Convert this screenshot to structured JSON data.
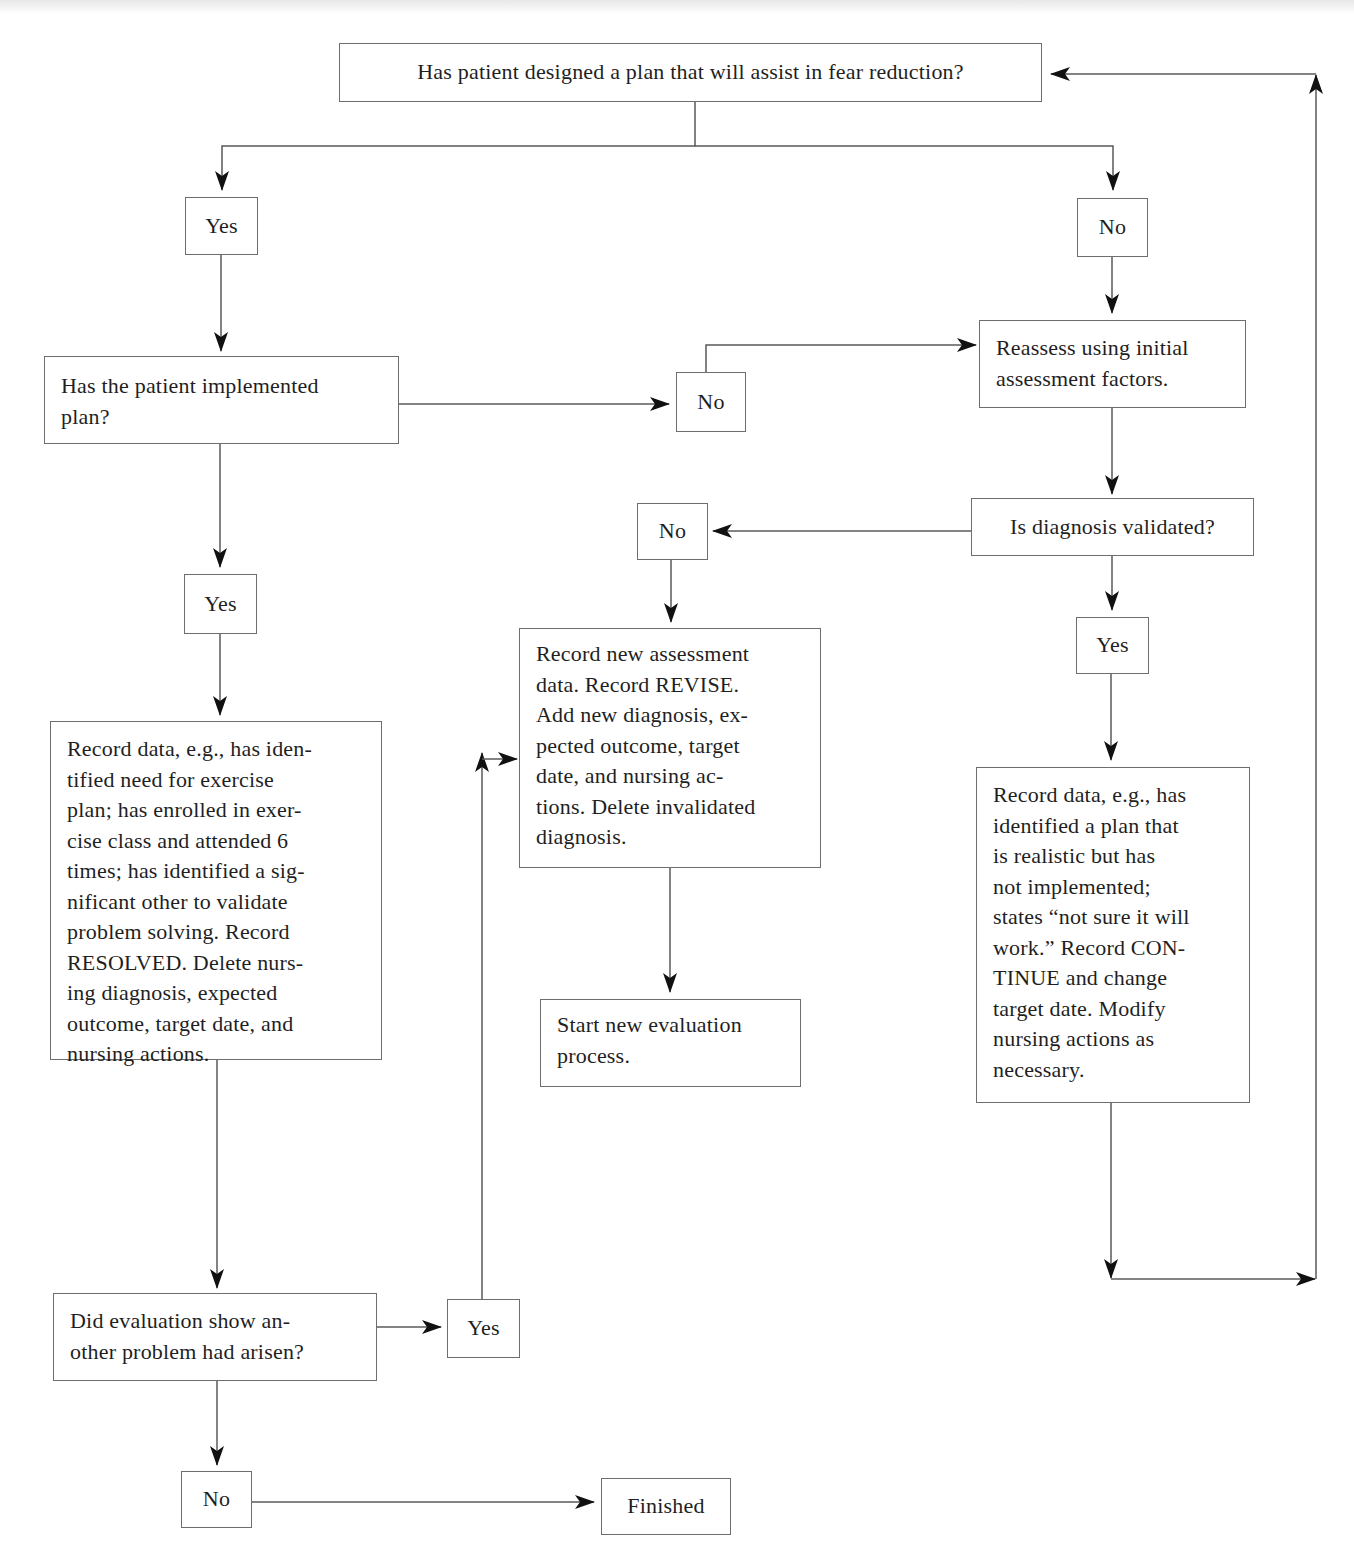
{
  "diagram": {
    "type": "flowchart",
    "topic": "Evaluation of fear-reduction plan",
    "nodes": {
      "q_plan_designed": "Has patient designed a plan that will assist in fear reduction?",
      "yes_1": "Yes",
      "no_1": "No",
      "q_implemented": "Has the patient implemented\nplan?",
      "no_2": "No",
      "reassess": "Reassess using initial\nassessment factors.",
      "q_validated": "Is diagnosis validated?",
      "no_3": "No",
      "yes_2": "Yes",
      "yes_3": "Yes",
      "record_resolved": "Record data, e.g., has iden-\ntified need for exercise\nplan; has enrolled in exer-\ncise class and attended 6\ntimes; has identified a sig-\nnificant other to validate\nproblem solving. Record\nRESOLVED. Delete nurs-\ning diagnosis, expected\noutcome, target date, and\nnursing actions.",
      "record_revise": "Record new assessment\ndata. Record REVISE.\nAdd new diagnosis, ex-\npected outcome, target\ndate, and nursing ac-\ntions. Delete invalidated\ndiagnosis.",
      "start_new": "Start new evaluation\nprocess.",
      "record_continue": "Record data, e.g., has\nidentified a plan that\nis realistic but has\nnot implemented;\nstates “not sure it will\nwork.” Record CON-\nTINUE and change\ntarget date. Modify\nnursing actions as\nnecessary.",
      "q_another_problem": "Did evaluation show an-\nother problem had arisen?",
      "yes_4": "Yes",
      "no_4": "No",
      "finished": "Finished"
    },
    "edges": [
      {
        "from": "q_plan_designed",
        "to": "yes_1"
      },
      {
        "from": "q_plan_designed",
        "to": "no_1"
      },
      {
        "from": "yes_1",
        "to": "q_implemented"
      },
      {
        "from": "q_implemented",
        "to": "no_2"
      },
      {
        "from": "q_implemented",
        "to": "yes_3"
      },
      {
        "from": "no_1",
        "to": "reassess"
      },
      {
        "from": "no_2",
        "to": "reassess"
      },
      {
        "from": "reassess",
        "to": "q_validated"
      },
      {
        "from": "q_validated",
        "to": "no_3"
      },
      {
        "from": "q_validated",
        "to": "yes_2"
      },
      {
        "from": "no_3",
        "to": "record_revise"
      },
      {
        "from": "record_revise",
        "to": "start_new"
      },
      {
        "from": "yes_2",
        "to": "record_continue"
      },
      {
        "from": "record_continue",
        "to": "q_plan_designed"
      },
      {
        "from": "yes_3",
        "to": "record_resolved"
      },
      {
        "from": "record_resolved",
        "to": "q_another_problem"
      },
      {
        "from": "q_another_problem",
        "to": "yes_4"
      },
      {
        "from": "q_another_problem",
        "to": "no_4"
      },
      {
        "from": "yes_4",
        "to": "record_revise"
      },
      {
        "from": "no_4",
        "to": "finished"
      }
    ],
    "colors": {
      "line": "#5a5a5a",
      "arrowhead": "#111111",
      "box_border": "#6e6e6e",
      "text": "#1f1f1f"
    }
  }
}
